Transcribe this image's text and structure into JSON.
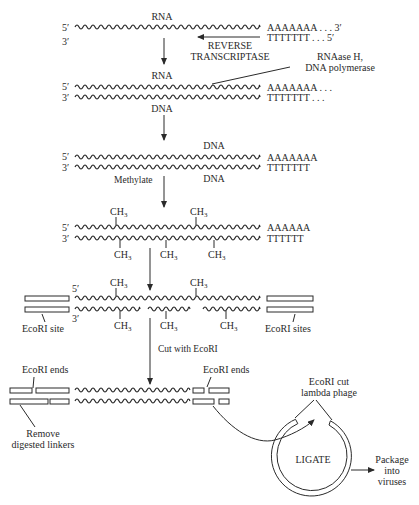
{
  "diagram": {
    "colors": {
      "ink": "#2a2a2a",
      "background": "#ffffff"
    },
    "step1": {
      "strand_top_label": "RNA",
      "five_prime": "5′",
      "three_prime": "3′",
      "polyA": "AAAAAAA . . . 3′",
      "polyT": "TTTTTTT . . . 5′",
      "enzyme_line1": "REVERSE",
      "enzyme_line2": "TRANSCRIPTASE"
    },
    "step2": {
      "enzyme_line1": "RNAase H,",
      "enzyme_line2": "DNA polymerase",
      "top_label": "RNA",
      "bottom_label": "DNA",
      "five_prime": "5′",
      "three_prime": "3′",
      "polyA": "AAAAAAA . . .",
      "polyT": "TTTTTTT . . ."
    },
    "step3": {
      "top_label": "DNA",
      "bottom_label": "DNA",
      "five_prime": "5′",
      "three_prime": "3′",
      "polyA": "AAAAAAA",
      "polyT": "TTTTTTT",
      "action": "Methylate"
    },
    "step4": {
      "five_prime": "5′",
      "three_prime": "3′",
      "polyA": "AAAAAA",
      "polyT": "TTTTTT",
      "methyl": "CH",
      "methyl_sub": "3"
    },
    "step5": {
      "five_prime": "5′",
      "three_prime": "3′",
      "methyl": "CH",
      "methyl_sub": "3",
      "left_label": "EcoRI site",
      "right_label": "EcoRI sites",
      "action": "Cut with EcoRI"
    },
    "step6": {
      "left_label": "EcoRI ends",
      "right_label": "EcoRI ends",
      "remove_line1": "Remove",
      "remove_line2": "digested linkers",
      "phage_line1": "EcoRI cut",
      "phage_line2": "lambda phage",
      "ligate": "LIGATE",
      "package_line1": "Package",
      "package_line2": "into",
      "package_line3": "viruses"
    }
  }
}
